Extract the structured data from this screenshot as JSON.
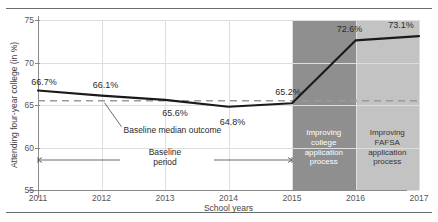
{
  "chart_data": {
    "type": "line",
    "title": "",
    "xlabel": "School years",
    "ylabel": "Attending four-year college (in %)",
    "x": [
      "2011",
      "2012",
      "2013",
      "2014",
      "2015",
      "2016",
      "2017"
    ],
    "categories": [
      "2011",
      "2012",
      "2013",
      "2014",
      "2015",
      "2016",
      "2017"
    ],
    "values": [
      66.7,
      66.1,
      65.6,
      64.8,
      65.2,
      72.6,
      73.1
    ],
    "point_labels": [
      "66.7%",
      "66.1%",
      "65.6%",
      "64.8%",
      "65.2%",
      "72.6%",
      "73.1%"
    ],
    "series": [
      {
        "name": "Attending four-year college",
        "values": [
          66.7,
          66.1,
          65.6,
          64.8,
          65.2,
          72.6,
          73.1
        ]
      }
    ],
    "ylim": [
      55,
      75
    ],
    "yticks": [
      55,
      60,
      65,
      70,
      75
    ],
    "ytick_labels": [
      "55",
      "60",
      "65",
      "70",
      "75"
    ],
    "xlim": [
      "2011",
      "2017"
    ],
    "grid": true,
    "legend": false,
    "baseline_median": 65.5,
    "baseline_median_label": "Baseline median outcome",
    "baseline_period_label": "Baseline\nperiod",
    "baseline_period_range": [
      "2011",
      "2015"
    ],
    "shaded_bands": [
      {
        "name": "improving-college-application-process",
        "from": "2015",
        "to": "2016",
        "label": "Improving\ncollege\napplication\nprocess",
        "color": "#8f8f8f",
        "text_color": "#ffffff"
      },
      {
        "name": "improving-fafsa-application-process",
        "from": "2016",
        "to": "2017",
        "label": "Improving\nFAFSA\napplication\nprocess",
        "color": "#c3c3c3",
        "text_color": "#333333"
      }
    ],
    "colors": {
      "line": "#1a1a1a",
      "grid": "#dedede",
      "axis": "#8a8a8a",
      "baseline_dash": "#9a9a9a",
      "band_dark": "#8f8f8f",
      "band_light": "#c3c3c3"
    }
  }
}
